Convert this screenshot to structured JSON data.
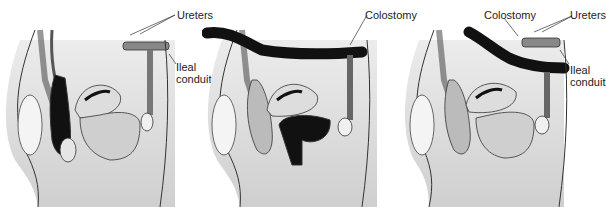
{
  "panels": [
    {
      "id": "panel-1",
      "labels": {
        "ureters": "Ureters",
        "ileal_1": "Ileal",
        "ileal_2": "conduit"
      }
    },
    {
      "id": "panel-2",
      "labels": {
        "colostomy": "Colostomy"
      }
    },
    {
      "id": "panel-3",
      "labels": {
        "colostomy": "Colostomy",
        "ureters": "Ureters",
        "ileal_1": "Ileal",
        "ileal_2": "conduit"
      }
    }
  ],
  "colors": {
    "line": "#333333",
    "shade": "#d6d6d6",
    "dark": "#1a1a1a",
    "mid": "#8a8a8a",
    "light": "#eeeeee"
  }
}
